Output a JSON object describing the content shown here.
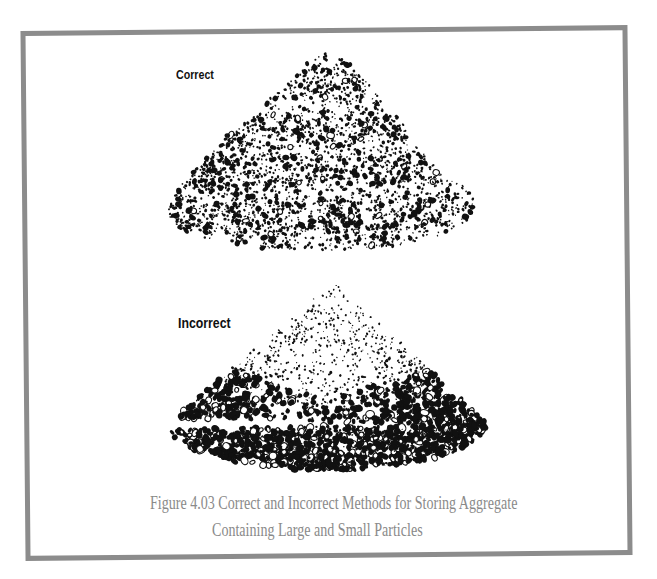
{
  "figure": {
    "caption_line1": "Figure 4.03  Correct and Incorrect Methods for Storing Aggregate",
    "caption_line2": "Containing Large and Small Particles",
    "frame_color": "#8c8c8c",
    "caption_color": "#8a8a8a"
  },
  "panels": [
    {
      "id": "correct",
      "label": "Correct",
      "description": "Aggregate stockpile built in layers; large and small particles evenly mixed throughout",
      "outline": [
        [
          325,
          53
        ],
        [
          345,
          58
        ],
        [
          360,
          75
        ],
        [
          378,
          95
        ],
        [
          385,
          112
        ],
        [
          400,
          117
        ],
        [
          410,
          140
        ],
        [
          428,
          157
        ],
        [
          440,
          172
        ],
        [
          468,
          188
        ],
        [
          476,
          203
        ],
        [
          470,
          220
        ],
        [
          440,
          236
        ],
        [
          400,
          246
        ],
        [
          330,
          250
        ],
        [
          260,
          248
        ],
        [
          210,
          240
        ],
        [
          175,
          228
        ],
        [
          166,
          212
        ],
        [
          172,
          198
        ],
        [
          185,
          180
        ],
        [
          205,
          160
        ],
        [
          225,
          137
        ],
        [
          250,
          120
        ],
        [
          270,
          98
        ],
        [
          290,
          82
        ],
        [
          305,
          63
        ]
      ],
      "particle_count": 2600,
      "segregated": false
    },
    {
      "id": "incorrect",
      "label": "Incorrect",
      "description": "Conical stockpile; small particles at top, large particles rolled to the base (segregation)",
      "apex": [
        333,
        280
      ],
      "base_left": [
        168,
        425
      ],
      "base_right": [
        486,
        424
      ],
      "base_bottom": 470,
      "particle_count": 2400,
      "segregated": true
    }
  ]
}
